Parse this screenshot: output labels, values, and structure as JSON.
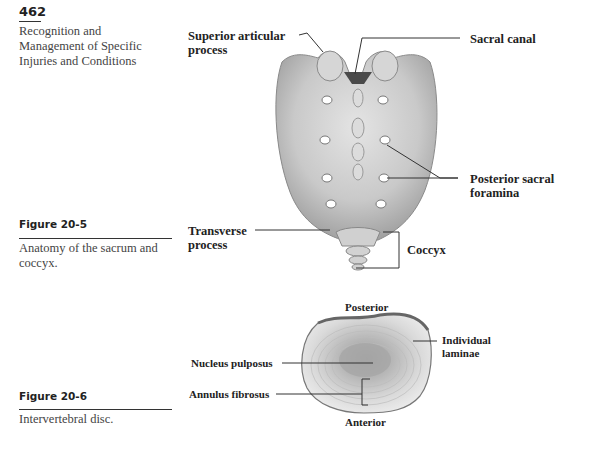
{
  "page": {
    "number": "462",
    "running_head": "Recognition and Management of Specific Injuries and Conditions"
  },
  "figures": [
    {
      "id": "Figure 20-5",
      "title": "Figure 20-5",
      "caption": "Anatomy of the sacrum and coccyx.",
      "labels": {
        "superior_articular_line1": "Superior articular",
        "superior_articular_line2": "process",
        "sacral_canal": "Sacral canal",
        "posterior_foramina_line1": "Posterior sacral",
        "posterior_foramina_line2": "foramina",
        "transverse_line1": "Transverse",
        "transverse_line2": "process",
        "coccyx": "Coccyx"
      }
    },
    {
      "id": "Figure 20-6",
      "title": "Figure 20-6",
      "caption": "Intervertebral disc.",
      "labels": {
        "posterior": "Posterior",
        "anterior": "Anterior",
        "individual_line1": "Individual",
        "individual_line2": "laminae",
        "nucleus": "Nucleus pulposus",
        "annulus": "Annulus fibrosus"
      }
    }
  ]
}
